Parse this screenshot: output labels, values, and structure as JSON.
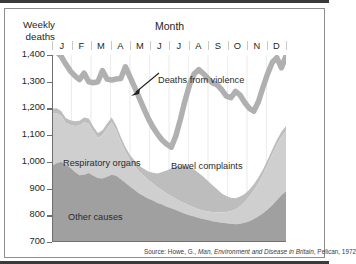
{
  "axis": {
    "y_title_line1": "Weekly",
    "y_title_line2": "deaths",
    "x_title": "Month",
    "y_ticks": [
      "1,400",
      "1,300",
      "1,200",
      "1,100",
      "1,000",
      "900",
      "800",
      "700"
    ],
    "x_ticks": [
      "J",
      "F",
      "M",
      "A",
      "M",
      "J",
      "J",
      "A",
      "S",
      "O",
      "N",
      "D"
    ]
  },
  "annotations": {
    "violence": "Deaths from violence",
    "respiratory": "Respiratory organs",
    "bowel": "Bowel complaints",
    "other": "Other causes"
  },
  "source": {
    "prefix": "Source: Howe, G., ",
    "title": "Man, Environment and Disease in Britain",
    "suffix": ", Pelican, 1972"
  },
  "colors": {
    "other_causes": "#a0a0a0",
    "respiratory": "#cfcfcf",
    "bowel": "#bdbdbd",
    "violence_band": "#b0b0b0",
    "gridline": "#ededed",
    "axis": "#6f6f6f",
    "frame": "#3a3a3a"
  },
  "chart_data": {
    "type": "area",
    "title": "",
    "subtitle": "",
    "xlabel": "Month",
    "ylabel": "Weekly deaths",
    "ylim": [
      700,
      1400
    ],
    "grid": true,
    "legend": "inline-labels",
    "note": "Stacked area chart of weekly deaths by cause over one year (52 weeks). Bands stack bottom-up: Other causes, Respiratory organs, Bowel complaints; the thick grey upper band is the total including Deaths from violence.",
    "x": [
      1,
      2,
      3,
      4,
      5,
      6,
      7,
      8,
      9,
      10,
      11,
      12,
      13,
      14,
      15,
      16,
      17,
      18,
      19,
      20,
      21,
      22,
      23,
      24,
      25,
      26,
      27,
      28,
      29,
      30,
      31,
      32,
      33,
      34,
      35,
      36,
      37,
      38,
      39,
      40,
      41,
      42,
      43,
      44,
      45,
      46,
      47,
      48,
      49,
      50,
      51,
      52
    ],
    "x_month_ticks": [
      "J",
      "F",
      "M",
      "A",
      "M",
      "J",
      "J",
      "A",
      "S",
      "O",
      "N",
      "D"
    ],
    "series": [
      {
        "name": "Other causes",
        "color": "#a0a0a0",
        "values": [
          985,
          995,
          1000,
          990,
          978,
          962,
          950,
          952,
          958,
          948,
          940,
          938,
          944,
          952,
          948,
          935,
          922,
          908,
          895,
          882,
          872,
          862,
          855,
          846,
          840,
          832,
          826,
          820,
          812,
          806,
          800,
          795,
          790,
          786,
          782,
          778,
          775,
          772,
          770,
          768,
          766,
          768,
          772,
          778,
          786,
          796,
          808,
          822,
          838,
          856,
          875,
          890
        ]
      },
      {
        "name": "Respiratory organs",
        "color": "#cfcfcf",
        "values": [
          196,
          188,
          172,
          156,
          160,
          172,
          186,
          196,
          186,
          166,
          150,
          162,
          182,
          196,
          170,
          140,
          116,
          100,
          90,
          82,
          76,
          70,
          64,
          58,
          54,
          50,
          46,
          42,
          40,
          38,
          36,
          34,
          32,
          32,
          32,
          34,
          36,
          38,
          42,
          48,
          56,
          66,
          78,
          92,
          108,
          126,
          146,
          168,
          190,
          208,
          220,
          226
        ]
      },
      {
        "name": "Bowel complaints",
        "color": "#bdbdbd",
        "values": [
          18,
          18,
          18,
          18,
          18,
          18,
          18,
          18,
          18,
          18,
          18,
          18,
          18,
          18,
          18,
          18,
          18,
          18,
          20,
          22,
          26,
          32,
          40,
          52,
          68,
          86,
          104,
          120,
          132,
          140,
          144,
          142,
          136,
          126,
          114,
          100,
          86,
          72,
          60,
          50,
          42,
          36,
          30,
          26,
          22,
          20,
          18,
          18,
          18,
          18,
          18,
          18
        ]
      },
      {
        "name": "Deaths from violence (total band)",
        "color": "#b0b0b0",
        "values": [
          1408,
          1412,
          1395,
          1366,
          1340,
          1322,
          1308,
          1332,
          1300,
          1296,
          1300,
          1342,
          1310,
          1306,
          1310,
          1312,
          1356,
          1318,
          1280,
          1240,
          1200,
          1162,
          1130,
          1104,
          1082,
          1066,
          1055,
          1098,
          1160,
          1230,
          1290,
          1330,
          1345,
          1330,
          1312,
          1295,
          1288,
          1270,
          1246,
          1240,
          1264,
          1250,
          1222,
          1200,
          1190,
          1226,
          1280,
          1330,
          1372,
          1390,
          1352,
          1396
        ]
      }
    ],
    "total_deaths_line": {
      "name": "Total weekly deaths (upper edge)",
      "values": [
        1408,
        1412,
        1395,
        1366,
        1340,
        1322,
        1308,
        1332,
        1300,
        1296,
        1300,
        1342,
        1310,
        1306,
        1310,
        1312,
        1356,
        1318,
        1280,
        1240,
        1200,
        1162,
        1130,
        1104,
        1082,
        1066,
        1055,
        1098,
        1160,
        1230,
        1290,
        1330,
        1345,
        1330,
        1312,
        1295,
        1288,
        1270,
        1246,
        1240,
        1264,
        1250,
        1222,
        1200,
        1190,
        1226,
        1280,
        1330,
        1372,
        1390,
        1352,
        1396
      ]
    }
  }
}
